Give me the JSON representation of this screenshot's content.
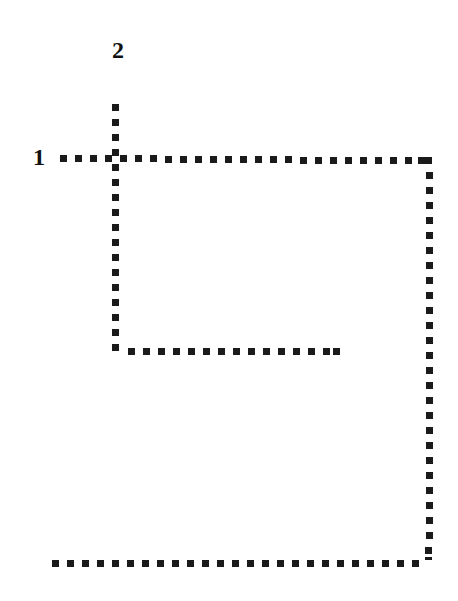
{
  "title_fragment": "g",
  "labels": {
    "line_1": "1",
    "line_2": "2"
  },
  "colors": {
    "dot": "#1a1a1a",
    "background": "#ffffff",
    "text": "#111111"
  },
  "lines": [
    {
      "id": "1",
      "description": "Starts left at label 1, runs right, turns down along right edge, then left along bottom",
      "path": [
        [
          63,
          158
        ],
        [
          428,
          160
        ],
        [
          429,
          557
        ],
        [
          420,
          560
        ],
        [
          52,
          563
        ]
      ]
    },
    {
      "id": "2",
      "description": "Starts at top below label 2, runs down, then turns right",
      "path": [
        [
          116,
          108
        ],
        [
          116,
          348
        ],
        [
          337,
          351
        ]
      ]
    }
  ]
}
